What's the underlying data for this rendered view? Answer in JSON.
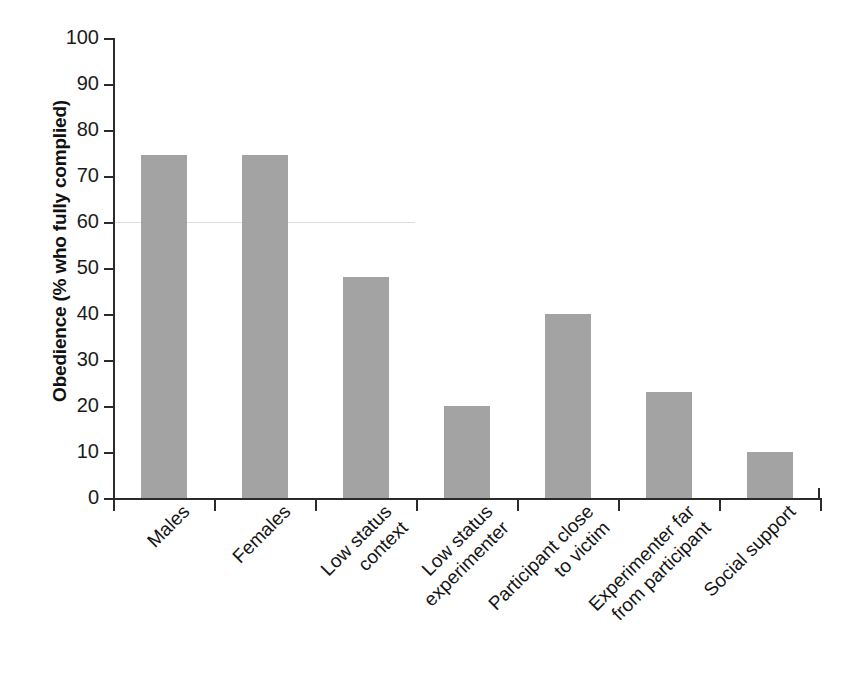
{
  "chart_data": {
    "type": "bar",
    "title": "",
    "xlabel": "",
    "ylabel": "Obedience (% who fully complied)",
    "ylim": [
      0,
      100
    ],
    "ytick_step": 10,
    "grid": false,
    "legend": false,
    "bar_color": "#a3a3a3",
    "axis_color": "#2b2b2b",
    "categories": [
      "Males",
      "Females",
      "Low status\ncontext",
      "Low status\nexperimenter",
      "Participant close\nto victim",
      "Experimenter far\nfrom participant",
      "Social support"
    ],
    "values": [
      74.5,
      74.5,
      48,
      20,
      40,
      23,
      10
    ],
    "ytick_labels": [
      "100",
      "90",
      "80",
      "70",
      "60",
      "50",
      "40",
      "30",
      "20",
      "10",
      "0"
    ],
    "ytick_values": [
      100,
      90,
      80,
      70,
      60,
      50,
      40,
      30,
      20,
      10,
      0
    ]
  },
  "figure": {
    "bleed_text": "·  ·  ·  ·  ·  ·  ·  ·  ·  ·  ·  ·  ·  ·  ·  ·  ·  ·  ·  ·  ·  ·  ·  ·  ·  ·  ·  ·"
  }
}
